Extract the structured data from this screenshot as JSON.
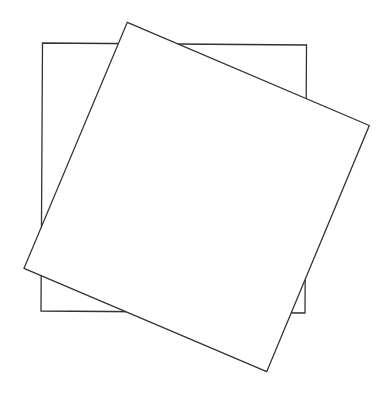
{
  "diagram": {
    "shapes": [
      {
        "id": "back-square",
        "kind": "square",
        "rotation_deg": 0,
        "fill": "#ffffff",
        "stroke": "#333333",
        "layer": "back"
      },
      {
        "id": "rotated-square",
        "kind": "square",
        "rotation_deg": 23,
        "fill": "#ffffff",
        "stroke": "#333333",
        "layer": "front"
      }
    ],
    "background": "#ffffff"
  }
}
